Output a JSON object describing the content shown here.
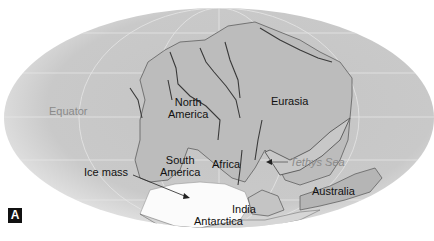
{
  "figure": {
    "panel_label": "A"
  },
  "labels": {
    "equator": "Equator",
    "north_america_1": "North",
    "north_america_2": "America",
    "eurasia": "Eurasia",
    "south_america_1": "South",
    "south_america_2": "America",
    "africa": "Africa",
    "tethys_sea": "Tethys Sea",
    "ice_mass": "Ice mass",
    "australia": "Australia",
    "india": "India",
    "antarctica": "Antarctica"
  },
  "colors": {
    "ocean": "#c8c8c8",
    "ocean_edge": "#e6e6e6",
    "land": "#b9b9b9",
    "ice": "#ffffff",
    "gridline": "#e8e8e8",
    "label_text": "#111111",
    "ocean_label_text": "#8a8a8a"
  }
}
